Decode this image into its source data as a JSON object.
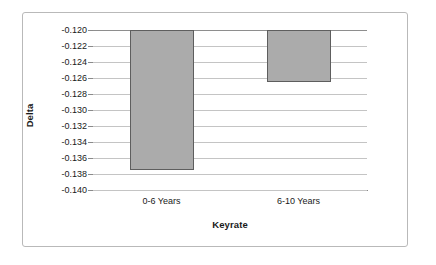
{
  "chart_data": {
    "type": "bar",
    "title": "",
    "categories": [
      "0-6 Years",
      "6-10 Years"
    ],
    "values": [
      -0.1375,
      -0.1265
    ],
    "series": [
      {
        "name": "Delta",
        "values": [
          -0.1375,
          -0.1265
        ]
      }
    ],
    "xlabel": "Keyrate",
    "ylabel": "Delta",
    "ylim": [
      -0.14,
      -0.12
    ],
    "y_tick_step": 0.002,
    "y_tick_labels": [
      "-0.120",
      "-0.122",
      "-0.124",
      "-0.126",
      "-0.128",
      "-0.130",
      "-0.132",
      "-0.134",
      "-0.136",
      "-0.138",
      "-0.140"
    ],
    "y_tick_values": [
      -0.12,
      -0.122,
      -0.124,
      -0.126,
      -0.128,
      -0.13,
      -0.132,
      -0.134,
      -0.136,
      -0.138,
      -0.14
    ],
    "bar_baseline": -0.12,
    "grid": true,
    "grid_axis": "y",
    "legend": false,
    "legend_position": "none",
    "colors": {
      "bar_fill": "#ababab",
      "bar_border": "#5e5e5e",
      "gridline": "#c4c4c4",
      "axis_line": "#8a8a8a",
      "frame_border": "#b9b9b9",
      "plot_background": "#ffffff",
      "text": "#1a1a1a"
    }
  }
}
